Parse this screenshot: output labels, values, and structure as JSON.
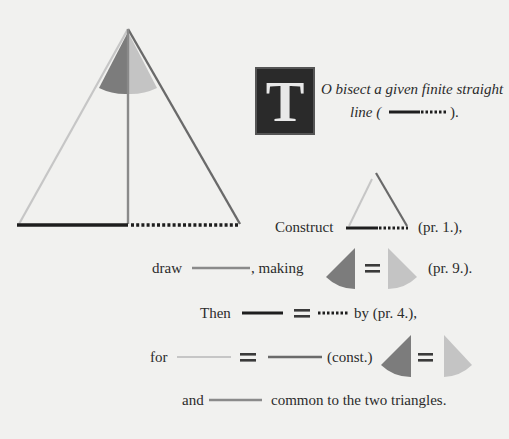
{
  "proposition": {
    "dropcap_letter": "T",
    "title_line1": "O bisect a given finite straight",
    "title_line2_prefix": "line (",
    "title_line2_suffix": ")."
  },
  "steps": {
    "construct": {
      "word": "Construct",
      "ref": "(pr. 1.),"
    },
    "draw": {
      "word": "draw",
      "connector": ", making",
      "ref": "(pr. 9.)."
    },
    "then": {
      "word": "Then",
      "ref": "by (pr. 4.),"
    },
    "for": {
      "word": "for",
      "ref": "(const.)"
    },
    "and": {
      "word": "and",
      "rest": "common to the two triangles."
    }
  },
  "symbols": {
    "equals": "="
  },
  "colors": {
    "background": "#f1f1ef",
    "solid_line": "#1e1e1e",
    "left_side": "#c4c4c4",
    "right_side": "#6e6e6e",
    "bisector": "#8a8a8a",
    "angle_dark": "#7c7c7c",
    "angle_light": "#c2c2c2",
    "text": "#2b2b2b"
  }
}
